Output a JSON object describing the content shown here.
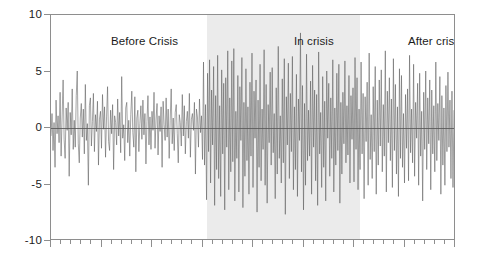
{
  "chart_data": {
    "type": "line",
    "title": "",
    "subtitle": "",
    "xlabel": "",
    "ylabel": "",
    "ylim": [
      -10,
      10
    ],
    "xlim": [
      0,
      400
    ],
    "grid": false,
    "legend_position": "none",
    "y_ticks": [
      {
        "value": 10,
        "label": "10"
      },
      {
        "value": 5,
        "label": "5"
      },
      {
        "value": 0,
        "label": "0"
      },
      {
        "value": -5,
        "label": "-5"
      },
      {
        "value": -10,
        "label": "-10"
      }
    ],
    "zero_line": 0,
    "x_tick_count": 41,
    "x_major_every": 5,
    "annotations": [
      {
        "name": "before-crisis",
        "text": "Before Crisis",
        "x_start": 0,
        "x_end": 154
      },
      {
        "name": "in-crisis",
        "text": "In crisis",
        "x_start": 154,
        "x_end": 305
      },
      {
        "name": "after-crisis",
        "text": "After crisis",
        "x_start": 305,
        "x_end": 400
      }
    ],
    "shaded_regions": [
      {
        "name": "in-crisis-band",
        "x_start": 154,
        "x_end": 305,
        "color": "#ebebeb"
      }
    ],
    "series": [
      {
        "name": "residual",
        "color": "#5a5a5a",
        "values": [
          -0.8,
          1.2,
          -2.1,
          0.4,
          -3.6,
          2.4,
          -0.6,
          1.0,
          -1.4,
          3.1,
          -2.6,
          0.9,
          4.2,
          -1.1,
          -2.8,
          1.7,
          -0.3,
          2.2,
          -4.4,
          1.3,
          -0.7,
          3.4,
          -2.0,
          0.6,
          -1.8,
          2.8,
          5.0,
          -1.5,
          -3.2,
          0.8,
          2.1,
          -0.9,
          1.6,
          -2.4,
          3.8,
          -1.2,
          0.3,
          -5.2,
          1.9,
          2.6,
          -1.7,
          0.5,
          3.0,
          -2.2,
          1.1,
          -0.4,
          2.3,
          -3.4,
          0.7,
          1.4,
          -1.9,
          2.9,
          -0.2,
          1.8,
          -2.7,
          0.9,
          3.6,
          -1.3,
          -2.1,
          1.5,
          -0.6,
          2.0,
          -3.8,
          1.0,
          0.4,
          -1.6,
          2.5,
          -0.8,
          1.3,
          -2.3,
          4.5,
          -1.0,
          0.2,
          -3.0,
          1.7,
          2.2,
          -1.4,
          0.6,
          -2.6,
          1.1,
          3.2,
          -0.5,
          -1.8,
          2.7,
          -4.0,
          0.8,
          1.5,
          -2.2,
          0.3,
          1.9,
          -1.1,
          2.4,
          -0.7,
          1.2,
          -3.3,
          0.5,
          2.8,
          -1.6,
          0.9,
          -2.0,
          1.4,
          -0.3,
          3.1,
          -1.9,
          0.7,
          2.1,
          -2.5,
          1.0,
          -0.4,
          1.8,
          -3.6,
          2.3,
          0.2,
          -1.2,
          2.6,
          -0.9,
          1.6,
          -2.8,
          0.6,
          3.4,
          -1.5,
          0.8,
          -2.1,
          1.3,
          2.0,
          -0.6,
          -3.2,
          1.1,
          0.4,
          -1.7,
          2.9,
          -0.8,
          1.9,
          -2.4,
          0.5,
          1.4,
          -1.0,
          3.0,
          -2.7,
          0.7,
          1.2,
          -0.3,
          2.2,
          -4.2,
          1.6,
          0.9,
          -1.8,
          2.5,
          -0.5,
          1.0,
          -2.9,
          5.8,
          -3.4,
          2.0,
          -6.5,
          4.8,
          -2.2,
          6.0,
          -5.0,
          3.3,
          -1.6,
          5.4,
          -7.0,
          2.8,
          -3.8,
          6.4,
          -4.6,
          1.9,
          -6.2,
          5.1,
          -2.4,
          3.9,
          -7.4,
          4.4,
          -1.8,
          6.8,
          -5.6,
          2.6,
          -4.0,
          5.9,
          -3.1,
          7.0,
          -6.6,
          1.4,
          -2.8,
          4.6,
          -5.8,
          3.6,
          -1.2,
          6.2,
          -7.2,
          2.2,
          -4.4,
          5.2,
          -3.0,
          1.8,
          -6.0,
          4.0,
          -2.6,
          6.6,
          -5.4,
          3.2,
          -1.0,
          4.2,
          -7.6,
          2.4,
          -3.6,
          5.6,
          -4.8,
          1.6,
          -2.0,
          6.9,
          -5.2,
          3.8,
          -6.8,
          2.0,
          -1.4,
          4.9,
          -3.4,
          5.3,
          -2.3,
          1.2,
          -6.4,
          3.5,
          -4.2,
          7.2,
          -2.8,
          1.0,
          -5.0,
          4.3,
          -3.2,
          6.1,
          -7.8,
          2.7,
          -1.6,
          5.7,
          -4.6,
          3.0,
          -2.2,
          6.3,
          -5.6,
          1.8,
          -3.8,
          4.7,
          -6.2,
          2.5,
          -1.2,
          8.4,
          -4.0,
          3.7,
          -7.4,
          2.1,
          -5.2,
          6.5,
          -3.0,
          1.5,
          -2.6,
          4.1,
          -6.0,
          5.5,
          -1.8,
          3.3,
          -4.8,
          2.9,
          -7.0,
          6.7,
          -2.4,
          1.3,
          -5.4,
          4.5,
          -3.6,
          2.3,
          -6.6,
          5.0,
          -1.0,
          3.9,
          -4.4,
          2.6,
          -2.8,
          6.0,
          -5.8,
          1.7,
          -3.4,
          4.8,
          -2.1,
          5.6,
          -6.8,
          2.2,
          -4.2,
          3.1,
          -1.5,
          5.9,
          -3.2,
          1.9,
          -2.5,
          4.6,
          -5.0,
          2.8,
          -1.1,
          3.5,
          -4.9,
          6.2,
          -2.0,
          4.4,
          -5.6,
          1.6,
          -3.8,
          5.8,
          -2.4,
          3.0,
          -6.4,
          2.7,
          -1.3,
          4.0,
          -5.2,
          6.6,
          -2.9,
          1.1,
          -4.6,
          3.6,
          -2.2,
          5.4,
          -6.0,
          2.4,
          -3.4,
          4.2,
          -1.7,
          5.1,
          -4.0,
          2.0,
          -2.6,
          6.8,
          -5.8,
          3.2,
          -1.4,
          4.4,
          -3.0,
          2.5,
          -5.4,
          6.1,
          -2.1,
          3.8,
          -4.2,
          1.8,
          -6.2,
          5.2,
          -2.8,
          4.6,
          -3.6,
          1.2,
          -5.0,
          2.9,
          -1.9,
          3.4,
          -4.8,
          6.4,
          -2.3,
          1.6,
          -3.2,
          5.6,
          -4.4,
          2.2,
          -1.0,
          3.9,
          -5.2,
          4.8,
          -2.6,
          1.4,
          -6.6,
          3.1,
          -2.0,
          5.0,
          -3.8,
          2.6,
          -1.5,
          4.2,
          -5.6,
          3.3,
          -2.4,
          1.9,
          -4.0,
          5.8,
          -3.0,
          2.1,
          -1.2,
          4.5,
          -6.0,
          2.8,
          -3.4,
          1.7,
          -5.2,
          3.7,
          -2.2,
          4.9,
          -1.8,
          2.4,
          -4.6,
          3.2,
          -5.4,
          1.5
        ]
      }
    ]
  }
}
